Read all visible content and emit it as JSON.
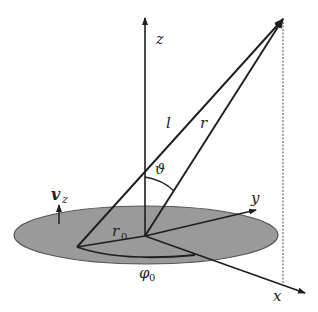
{
  "diagram": {
    "type": "coordinate-geometry",
    "labels": {
      "z_axis": "z",
      "y_axis": "y",
      "x_axis": "x",
      "l_vector": "l",
      "r_vector": "r",
      "theta": "ϑ",
      "r0": "r",
      "r0_sub": "0",
      "phi0": "φ",
      "phi0_sub": "0",
      "vz": "v",
      "vz_sub": "z"
    },
    "colors": {
      "disk_fill": "#9a9a9a",
      "disk_stroke": "#555555",
      "line": "#1e1e1e",
      "dotted": "#777777"
    }
  }
}
